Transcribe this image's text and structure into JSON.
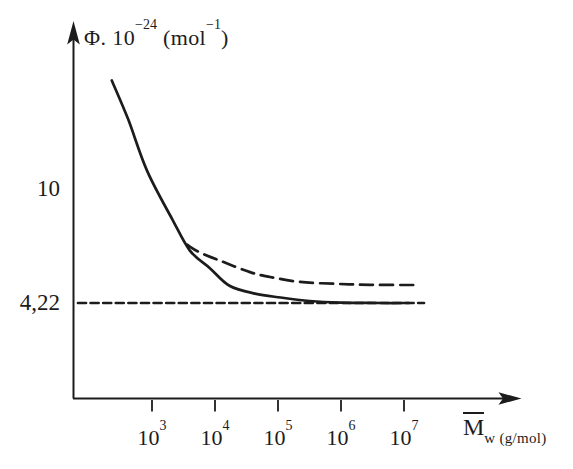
{
  "figure": {
    "background": "#ffffff",
    "ink_color": "#1c1c1c"
  },
  "chart_data": {
    "type": "line",
    "title": "Φ. 10−24 (mol−1)",
    "title_parts": {
      "p1": "Φ. 10",
      "e1": "−24",
      "p2": " (mol",
      "e2": "−1",
      "p3": ")"
    },
    "xlabel": "M̄w (g/mol)",
    "xlabel_parts": {
      "symbol": "M",
      "sub": "w (g/mol)"
    },
    "x_scale": "log",
    "y_scale": "linear",
    "xlim": [
      100,
      30000000
    ],
    "ylim": [
      0,
      17
    ],
    "grid": false,
    "legend": "none",
    "x_ticks": [
      {
        "base": "10",
        "exp": "3",
        "value": 1000
      },
      {
        "base": "10",
        "exp": "4",
        "value": 10000
      },
      {
        "base": "10",
        "exp": "5",
        "value": 100000
      },
      {
        "base": "10",
        "exp": "6",
        "value": 1000000
      },
      {
        "base": "10",
        "exp": "7",
        "value": 10000000
      }
    ],
    "y_ticks": [
      {
        "label": "10",
        "value": 10
      },
      {
        "label": "4,22",
        "value": 4.22
      }
    ],
    "asymptote": {
      "value": 4.22,
      "label": "4,22",
      "style": "short-dash"
    },
    "series": [
      {
        "name": "solid-curve",
        "style": "solid",
        "M": [
          230,
          420,
          830,
          2100,
          4000,
          8300,
          17000,
          43000,
          110000,
          320000,
          1000000,
          4200000,
          12000000
        ],
        "phi": [
          15.6,
          13.6,
          11.0,
          8.5,
          6.9,
          6.0,
          5.1,
          4.7,
          4.5,
          4.32,
          4.24,
          4.22,
          4.22
        ]
      },
      {
        "name": "dashed-branch-curve",
        "style": "long-dash",
        "M": [
          3600,
          5800,
          14000,
          36000,
          75000,
          220000,
          830000,
          2900000,
          15000000
        ],
        "phi": [
          7.2,
          6.8,
          6.3,
          5.8,
          5.55,
          5.3,
          5.2,
          5.15,
          5.14
        ]
      }
    ]
  }
}
